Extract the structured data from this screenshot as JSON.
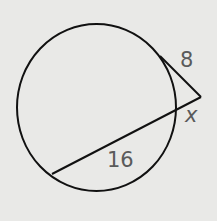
{
  "diagram": {
    "type": "circle with tangent and secant from external point",
    "labels": {
      "tangent": "8",
      "external_secant": "x",
      "internal_secant": "16"
    },
    "colors": {
      "background": "#e9e9e7",
      "stroke": "#111111",
      "label": "#5a5a5a"
    }
  }
}
